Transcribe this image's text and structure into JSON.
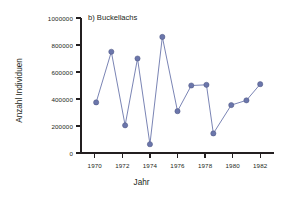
{
  "chart_data": {
    "type": "line",
    "title": "b) Buckellachs",
    "xlabel": "Jahr",
    "ylabel": "Anzahl Individuen",
    "xlim": [
      1969.0,
      1983.0
    ],
    "ylim": [
      0,
      1000000
    ],
    "xticks": [
      1970,
      1972,
      1974,
      1976,
      1978,
      1980,
      1982
    ],
    "xtick_labels": [
      "1970",
      "1972",
      "1974",
      "1976",
      "1978",
      "1980",
      "1982"
    ],
    "yticks": [
      0,
      200000,
      400000,
      600000,
      800000,
      1000000
    ],
    "ytick_labels": [
      "0",
      "200000",
      "400000",
      "600000",
      "800000",
      "1000000"
    ],
    "grid": false,
    "legend": null,
    "marker": "circle",
    "series": [
      {
        "name": "Buckellachs",
        "color": "#6b76ab",
        "x": [
          1970.1,
          1971.2,
          1972.2,
          1973.1,
          1974.0,
          1974.9,
          1976.0,
          1977.0,
          1978.1,
          1978.6,
          1979.9,
          1981.0,
          1982.0
        ],
        "values": [
          375000,
          750000,
          205000,
          700000,
          65000,
          860000,
          310000,
          500000,
          505000,
          145000,
          355000,
          390000,
          510000
        ]
      }
    ]
  },
  "axes_geometry": {
    "left_px": 81,
    "right_px": 274,
    "top_px": 18,
    "bottom_px": 153,
    "axis_color": "#231f20",
    "tick_length_px": 5
  }
}
